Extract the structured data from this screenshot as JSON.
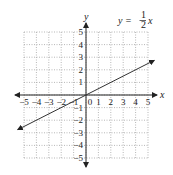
{
  "chart_data": {
    "type": "line",
    "title": "",
    "annotation": {
      "lhs": "y = ",
      "numerator": "1",
      "denominator": "2",
      "var": "x"
    },
    "xlabel": "x",
    "ylabel": "y",
    "xlim": [
      -5,
      5
    ],
    "ylim": [
      -5,
      5
    ],
    "grid": true,
    "grid_style": "dotted",
    "x_ticks": [
      -5,
      -4,
      -3,
      -2,
      -1,
      0,
      1,
      2,
      3,
      4,
      5
    ],
    "y_ticks": [
      -5,
      -4,
      -3,
      -2,
      -1,
      1,
      2,
      3,
      4,
      5
    ],
    "x_tick_labels": [
      "−5",
      "−4",
      "−3",
      "−2",
      "−1",
      "0",
      "1",
      "2",
      "3",
      "4",
      "5"
    ],
    "y_tick_labels": [
      "−5",
      "−4",
      "−3",
      "−2",
      "−1",
      "1",
      "2",
      "3",
      "4",
      "5"
    ],
    "series": [
      {
        "name": "y = (1/2)x",
        "slope": 0.5,
        "intercept": 0,
        "x": [
          -5.5,
          5.5
        ],
        "y": [
          -2.75,
          2.75
        ],
        "arrows": "both"
      }
    ],
    "colors": {
      "axis": "#222222",
      "grid": "#9a9a9a",
      "line": "#333333"
    }
  }
}
